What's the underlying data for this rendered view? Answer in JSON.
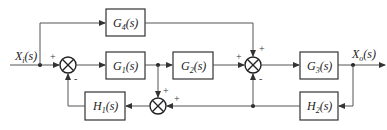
{
  "diagram": {
    "type": "control-system-block-diagram",
    "input": {
      "label": "X",
      "sub": "i",
      "arg": "(s)"
    },
    "output": {
      "label": "X",
      "sub": "o",
      "arg": "(s)"
    },
    "blocks": [
      {
        "id": "G4",
        "label": "G",
        "sub": "4",
        "arg": "(s)"
      },
      {
        "id": "G1",
        "label": "G",
        "sub": "1",
        "arg": "(s)"
      },
      {
        "id": "G2",
        "label": "G",
        "sub": "2",
        "arg": "(s)"
      },
      {
        "id": "G3",
        "label": "G",
        "sub": "3",
        "arg": "(s)"
      },
      {
        "id": "H1",
        "label": "H",
        "sub": "1",
        "arg": "(s)"
      },
      {
        "id": "H2",
        "label": "H",
        "sub": "2",
        "arg": "(s)"
      }
    ],
    "summing_junctions": [
      {
        "id": "S1",
        "signs": {
          "left": "+",
          "bottom": "-"
        }
      },
      {
        "id": "S2",
        "signs": {
          "left": "+",
          "top": "+",
          "bottom": "-"
        }
      },
      {
        "id": "S3",
        "signs": {
          "top": "+",
          "right": "+"
        }
      }
    ],
    "connections": [
      "X_i -> S1(+)",
      "X_i -> G4",
      "S1 -> G1",
      "G1 -> G2",
      "G1 -> S3(+)",
      "G2 -> S2(+)",
      "G4 -> S2(+)",
      "S2 -> G3",
      "G3 -> X_o",
      "X_o -> H2",
      "H2 -> S2(-)",
      "H2 -> S3(+)",
      "S3 -> H1",
      "H1 -> S1(-)"
    ]
  }
}
